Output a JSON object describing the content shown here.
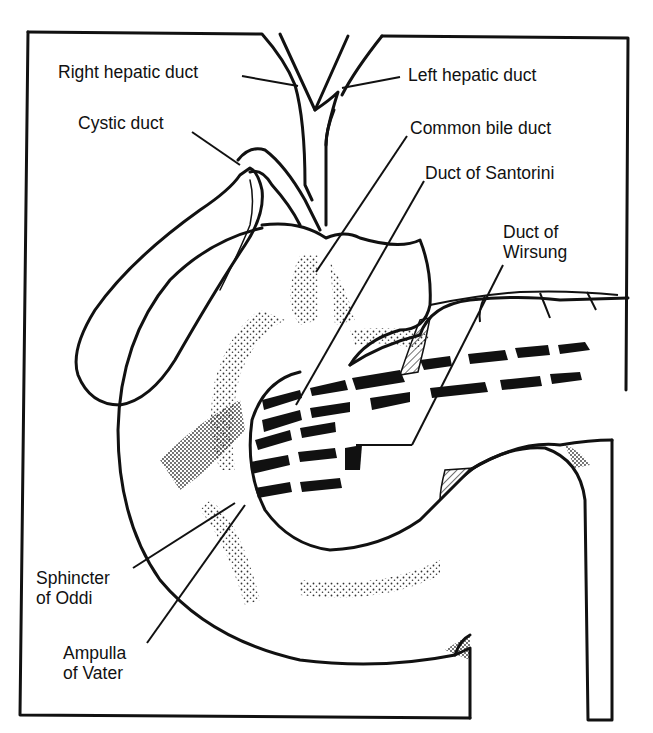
{
  "diagram": {
    "ink_color": "#111111",
    "background_color": "#ffffff",
    "labels": [
      {
        "id": "right-hepatic-duct",
        "lines": [
          "Right hepatic duct"
        ]
      },
      {
        "id": "left-hepatic-duct",
        "lines": [
          "Left hepatic duct"
        ]
      },
      {
        "id": "cystic-duct",
        "lines": [
          "Cystic duct"
        ]
      },
      {
        "id": "common-bile-duct",
        "lines": [
          "Common bile duct"
        ]
      },
      {
        "id": "duct-of-santorini",
        "lines": [
          "Duct of Santorini"
        ]
      },
      {
        "id": "duct-of-wirsung",
        "lines": [
          "Duct of",
          "Wirsung"
        ]
      },
      {
        "id": "sphincter-of-oddi",
        "lines": [
          "Sphincter",
          "of Oddi"
        ]
      },
      {
        "id": "ampulla-of-vater",
        "lines": [
          "Ampulla",
          "of Vater"
        ]
      }
    ],
    "structures": [
      "gallbladder",
      "hepatic ducts",
      "common bile duct",
      "pancreas",
      "pancreatic duct",
      "duodenum"
    ]
  }
}
